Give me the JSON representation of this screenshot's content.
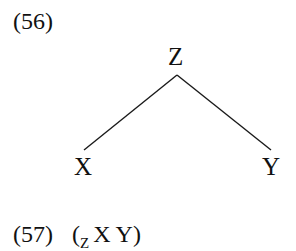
{
  "examples": [
    {
      "number": "(56)",
      "type": "tree",
      "tree": {
        "root": "Z",
        "children": [
          "X",
          "Y"
        ]
      }
    },
    {
      "number": "(57)",
      "type": "labeled-bracketing",
      "bracketing": {
        "open": "(",
        "label": "Z",
        "content": "X Y",
        "close": ")"
      }
    }
  ]
}
